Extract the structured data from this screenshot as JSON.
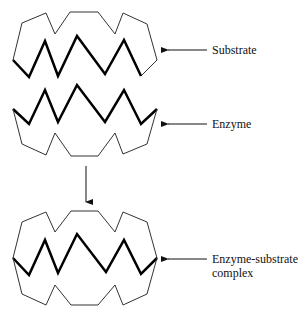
{
  "diagram": {
    "labels": {
      "substrate": "Substrate",
      "enzyme": "Enzyme",
      "complex_line1": "Enzyme-substrate",
      "complex_line2": "complex"
    },
    "colors": {
      "outline": "#333333",
      "zigzag": "#000000",
      "text": "#111111",
      "background": "#ffffff"
    }
  }
}
